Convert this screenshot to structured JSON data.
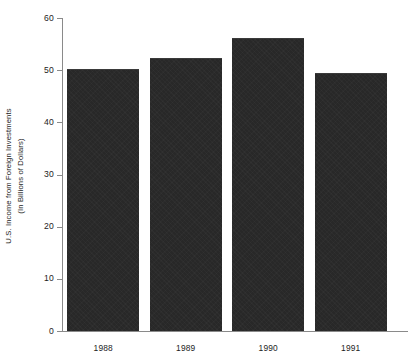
{
  "chart_data": {
    "type": "bar",
    "title": "",
    "subtitle": "",
    "xlabel": "",
    "ylabel": "U.S. Income from Foreign Investments (In Billions of Dollars)",
    "ylabel_lines": [
      "U.S. Income from Foreign Investments",
      "(In Billions of Dollars)"
    ],
    "categories": [
      "1988",
      "1989",
      "1990",
      "1991"
    ],
    "values": [
      50.3,
      52.4,
      56.2,
      49.4
    ],
    "series": [
      {
        "name": "U.S. Income from Foreign Investments",
        "values": [
          50.3,
          52.4,
          56.2,
          49.4
        ]
      }
    ],
    "ylim": [
      0,
      60
    ],
    "xlim": [
      0,
      4
    ],
    "y_ticks": [
      0,
      10,
      20,
      30,
      40,
      50,
      60
    ],
    "y_tick_labels": [
      "0",
      "10",
      "20",
      "30",
      "40",
      "50",
      "60"
    ],
    "x_tick_labels": [
      "1988",
      "1989",
      "1990",
      "1991"
    ],
    "grid": false,
    "legend": null,
    "legend_position": "none",
    "annotations": [],
    "bar_color": "#282828",
    "axis_color": "#8a8a8a",
    "text_color": "#1c1c1c",
    "background_color": "#ffffff"
  }
}
